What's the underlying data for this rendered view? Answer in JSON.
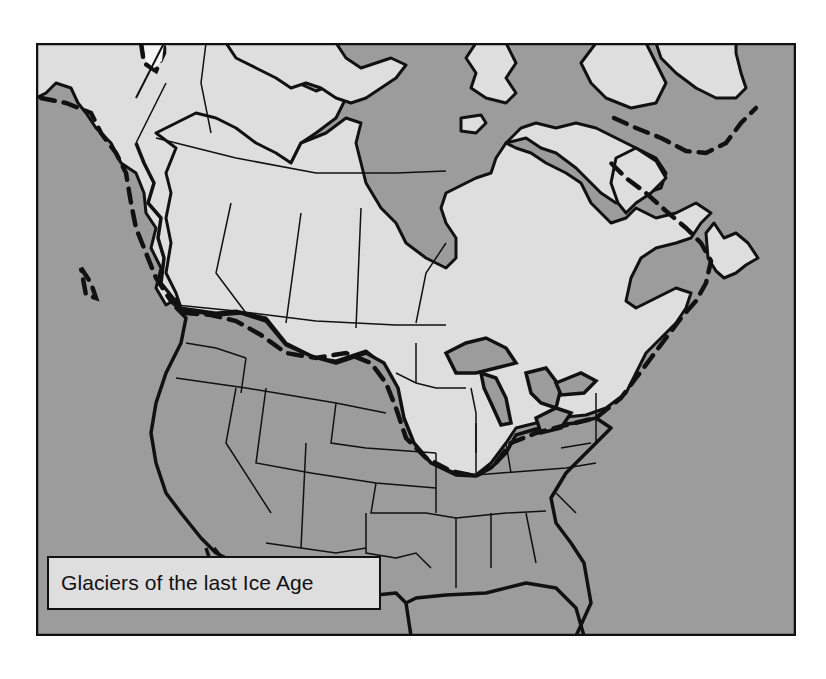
{
  "map": {
    "title": "Glaciers of the last Ice Age",
    "region": "North America",
    "colors": {
      "water_and_unglaciated": "#9c9c9c",
      "glaciated_land": "#dedede",
      "border": "#111111",
      "background": "#ffffff"
    },
    "legend": {
      "label": "Glaciers of the last Ice Age"
    },
    "features": [
      {
        "name": "glacier-extent",
        "style": "light gray fill (ice-covered land)"
      },
      {
        "name": "glacier-limit-line",
        "style": "dashed black line"
      },
      {
        "name": "coastline",
        "style": "thick black line"
      },
      {
        "name": "political-borders",
        "style": "thin black lines"
      }
    ]
  }
}
